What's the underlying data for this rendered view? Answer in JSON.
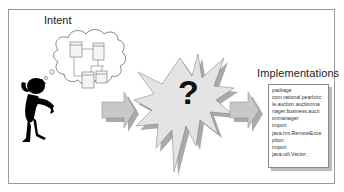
{
  "diagram": {
    "labels": {
      "intent": "Intent",
      "implementations": "Implementations",
      "unknown": "?"
    },
    "code_snippet": [
      "package",
      "com.rational.pearlcirc",
      "le.auction.auctionma",
      "nager.business.aucti",
      "onmanager;",
      "import",
      "java.rmi.RemoteExce",
      "ption;",
      "import",
      "java.util.Vector;"
    ],
    "icons": {
      "person": "thinking-person-icon",
      "thought_bubble": "thought-cloud-icon",
      "uml": "uml-class-diagram-icon",
      "arrow": "right-arrow-icon",
      "burst": "explosion-burst-icon"
    },
    "colors": {
      "arrow_fill": "#c8c8c8",
      "burst_fill": "#e4e4e4",
      "shadow": "#a9a9a9",
      "frame": "#9a9a9a"
    }
  }
}
